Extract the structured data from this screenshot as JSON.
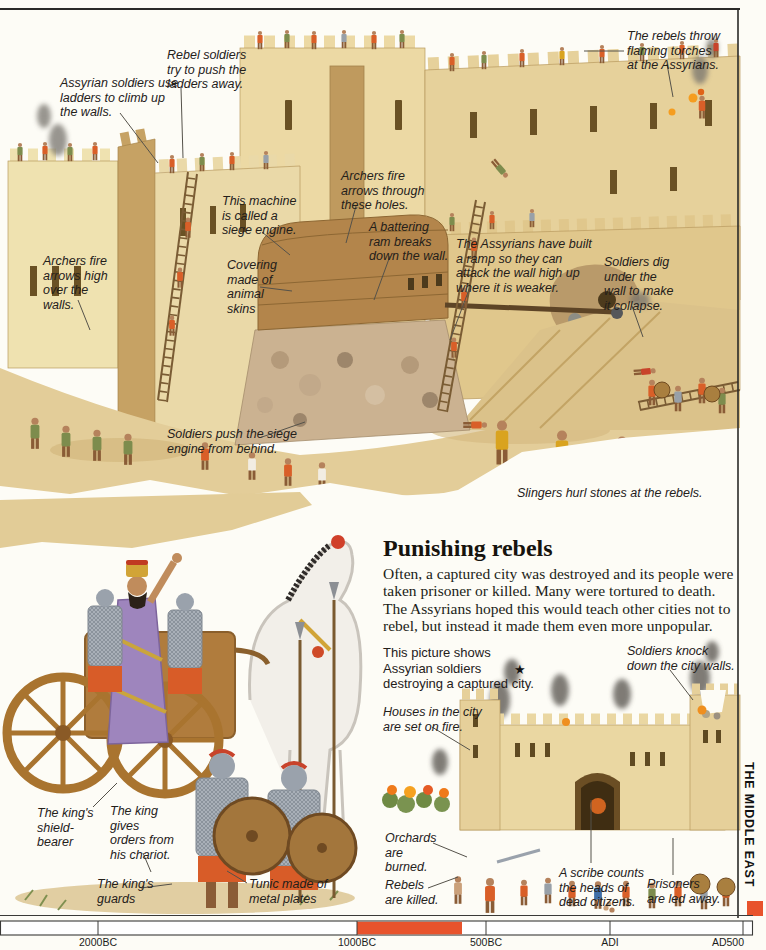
{
  "palette": {
    "accent": "#e8532c",
    "wall": "#ead9a8",
    "wall_shade": "#c6a264",
    "ground": "#e3cd99",
    "ink": "#201d16"
  },
  "sidebar": {
    "label": "THE MIDDLE EAST"
  },
  "siege_scene": {
    "callouts": [
      "Assyrian soldiers use ladders to climb up the walls.",
      "Rebel soldiers try to push the ladders away.",
      "The rebels throw flaming torches at the Assyrians.",
      "Archers fire arrows high over the walls.",
      "This machine is called a siege engine.",
      "Covering made of animal skins",
      "Archers fire arrows through these holes.",
      "A battering ram breaks down the wall.",
      "The Assyrians have built a ramp so they can attack the wall high up where it is weaker.",
      "Soldiers dig under the wall to make it collapse.",
      "Soldiers push the siege engine from behind.",
      "Slingers hurl stones at the rebels."
    ]
  },
  "punishing_rebels": {
    "heading": "Punishing rebels",
    "body": "Often, a captured city was destroyed and its people were taken prisoner or killed. Many were tortured to death. The Assyrians hoped this would teach other cities not to rebel, but instead it made them even more unpopular.",
    "caption": "This picture shows Assyrian soldiers destroying a captured city.",
    "star": "★",
    "callouts": [
      "Soldiers knock down the city walls.",
      "Houses in the city are set on fire.",
      "Orchards are burned.",
      "Rebels are killed.",
      "A scribe counts the heads of dead citizens.",
      "Prisoners are led away."
    ]
  },
  "chariot_scene": {
    "callouts": [
      "The king's shield-bearer",
      "The king gives orders from his chariot.",
      "The king's guards",
      "Tunic made of metal plates"
    ]
  },
  "timeline": {
    "ticks": [
      "2000BC",
      "1000BC",
      "500BC",
      "ADI",
      "AD500"
    ],
    "highlight_color": "#e8532c"
  }
}
